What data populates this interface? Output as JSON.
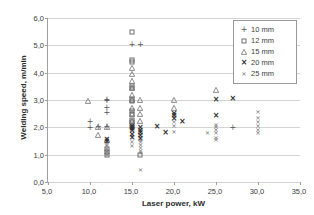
{
  "chart_data": {
    "type": "scatter",
    "title": "",
    "xlabel": "Laser power, kW",
    "ylabel": "Welding speed, m/min",
    "xlim": [
      5.0,
      35.0
    ],
    "ylim": [
      0.0,
      6.0
    ],
    "xticks": [
      "5,0",
      "10,0",
      "15,0",
      "20,0",
      "25,0",
      "30,0",
      "35,0"
    ],
    "xtick_values": [
      5,
      10,
      15,
      20,
      25,
      30,
      35
    ],
    "yticks": [
      "0,0",
      "1,0",
      "2,0",
      "3,0",
      "4,0",
      "5,0",
      "6,0"
    ],
    "ytick_values": [
      0,
      1,
      2,
      3,
      4,
      5,
      6
    ],
    "grid": "horizontal",
    "legend_position": "top-right",
    "decimal_separator": ",",
    "series": [
      {
        "name": "10 mm",
        "marker": "plus",
        "points": [
          [
            10,
            2.18
          ],
          [
            10,
            1.97
          ],
          [
            11,
            2.0
          ],
          [
            12,
            3.0
          ],
          [
            12,
            2.95
          ],
          [
            12,
            2.72
          ],
          [
            12,
            2.52
          ],
          [
            12,
            2.0
          ],
          [
            15,
            5.0
          ],
          [
            16,
            5.0
          ],
          [
            15,
            2.05
          ],
          [
            15,
            1.98
          ],
          [
            27,
            1.98
          ]
        ]
      },
      {
        "name": "12 mm",
        "marker": "square",
        "points": [
          [
            15,
            5.48
          ],
          [
            15,
            4.48
          ],
          [
            15,
            4.4
          ],
          [
            15,
            3.5
          ],
          [
            15,
            3.45
          ],
          [
            15,
            3.02
          ],
          [
            15,
            2.98
          ],
          [
            15,
            2.6
          ],
          [
            15,
            2.5
          ],
          [
            15,
            2.28
          ],
          [
            15,
            2.2
          ],
          [
            15,
            2.02
          ],
          [
            12,
            1.2
          ],
          [
            12,
            1.1
          ],
          [
            12,
            1.0
          ],
          [
            16,
            1.0
          ]
        ]
      },
      {
        "name": "15 mm",
        "marker": "triangle",
        "points": [
          [
            9.8,
            2.98
          ],
          [
            11,
            2.0
          ],
          [
            11,
            1.72
          ],
          [
            12,
            2.0
          ],
          [
            12,
            1.55
          ],
          [
            15,
            4.18
          ],
          [
            15,
            3.95
          ],
          [
            15,
            3.7
          ],
          [
            15,
            3.45
          ],
          [
            15,
            3.2
          ],
          [
            15,
            3.0
          ],
          [
            15,
            2.72
          ],
          [
            15,
            2.5
          ],
          [
            15,
            2.22
          ],
          [
            16,
            3.0
          ],
          [
            16,
            2.72
          ],
          [
            16,
            2.5
          ],
          [
            16,
            2.22
          ],
          [
            20,
            3.0
          ],
          [
            20,
            2.72
          ],
          [
            25,
            3.35
          ]
        ]
      },
      {
        "name": "20 mm",
        "marker": "cross-bold",
        "points": [
          [
            12,
            1.55
          ],
          [
            12,
            1.45
          ],
          [
            15,
            2.0
          ],
          [
            15,
            1.95
          ],
          [
            15,
            1.85
          ],
          [
            15,
            1.72
          ],
          [
            15,
            1.6
          ],
          [
            16,
            1.98
          ],
          [
            16,
            1.88
          ],
          [
            16,
            1.78
          ],
          [
            16,
            1.68
          ],
          [
            16,
            1.58
          ],
          [
            18,
            2.0
          ],
          [
            19,
            1.8
          ],
          [
            20,
            2.5
          ],
          [
            20,
            2.4
          ],
          [
            20,
            2.3
          ],
          [
            21,
            2.18
          ],
          [
            25,
            3.0
          ],
          [
            25,
            2.4
          ],
          [
            27,
            3.05
          ]
        ]
      },
      {
        "name": "25 mm",
        "marker": "cross-small",
        "points": [
          [
            12,
            1.4
          ],
          [
            12,
            1.3
          ],
          [
            12,
            1.2
          ],
          [
            12,
            1.1
          ],
          [
            12,
            1.0
          ],
          [
            15,
            1.45
          ],
          [
            15,
            1.3
          ],
          [
            16,
            1.55
          ],
          [
            16,
            1.45
          ],
          [
            16,
            1.35
          ],
          [
            16,
            1.25
          ],
          [
            16,
            1.15
          ],
          [
            16,
            1.05
          ],
          [
            16,
            0.45
          ],
          [
            20,
            2.2
          ],
          [
            20,
            2.05
          ],
          [
            20,
            1.82
          ],
          [
            24,
            1.78
          ],
          [
            25,
            2.1
          ],
          [
            25,
            2.0
          ],
          [
            25,
            1.9
          ],
          [
            25,
            1.78
          ],
          [
            25,
            1.62
          ],
          [
            25,
            1.52
          ],
          [
            30,
            2.55
          ],
          [
            30,
            2.35
          ],
          [
            30,
            2.2
          ],
          [
            30,
            2.05
          ],
          [
            30,
            1.92
          ],
          [
            30,
            1.78
          ]
        ]
      }
    ]
  },
  "legend": {
    "items": [
      {
        "label": "10 mm",
        "marker": "plus"
      },
      {
        "label": "12 mm",
        "marker": "square"
      },
      {
        "label": "15 mm",
        "marker": "triangle"
      },
      {
        "label": "20 mm",
        "marker": "cross-bold"
      },
      {
        "label": "25 mm",
        "marker": "cross-small"
      }
    ]
  },
  "colors": {
    "background": "#ffffff",
    "gridline": "#d4d4d4",
    "axis": "#a0a0a0",
    "text": "#3c3c3c",
    "marker": "#555555"
  }
}
